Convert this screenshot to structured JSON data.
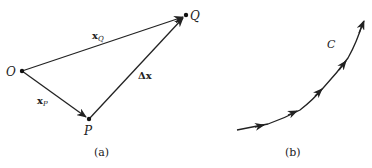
{
  "panel_a": {
    "caption": "(a)",
    "points": {
      "O": {
        "label": "O",
        "x": 22,
        "y": 71
      },
      "P": {
        "label": "P",
        "x": 89,
        "y": 119
      },
      "Q": {
        "label": "Q",
        "x": 186,
        "y": 15
      }
    },
    "vectors": {
      "xQ": {
        "base": "x",
        "sub": "Q"
      },
      "xP": {
        "base": "x",
        "sub": "P"
      },
      "dx": {
        "label": "Δx"
      }
    }
  },
  "panel_b": {
    "caption": "(b)",
    "curve_label": "C"
  },
  "colors": {
    "stroke": "#222222",
    "background": "#ffffff"
  }
}
